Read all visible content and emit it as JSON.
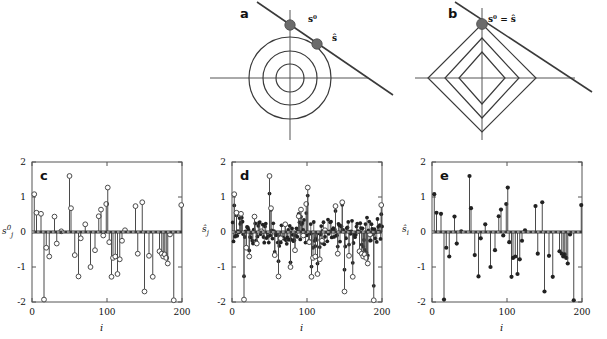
{
  "figure": {
    "caption_letters": [
      "a",
      "b",
      "c",
      "d",
      "e"
    ],
    "colors": {
      "stroke": "#3a3a3a",
      "marker_fill": "#6b6b6b",
      "axis": "#555555",
      "text": "#111111"
    }
  },
  "panel_a": {
    "letter": "a",
    "type": "geometry",
    "contour_shape": "circle",
    "contour_count": 3,
    "label_s0": "s⁰",
    "label_shat": "ŝ",
    "description": "L2 / ridge: circular contours intersect constraint line away from axis"
  },
  "panel_b": {
    "letter": "b",
    "type": "geometry",
    "contour_shape": "diamond",
    "contour_count": 3,
    "label_equality": "s⁰ = ŝ",
    "description": "L1 / lasso: diamond contours touch constraint line at vertex"
  },
  "chart_data": [
    {
      "panel": "c",
      "letter": "c",
      "type": "stem",
      "marker": "open-circle",
      "title": "",
      "xlabel": "i",
      "ylabel": "s⁰j",
      "ylabel_parts": {
        "base": "s",
        "sup": "0",
        "sub": "j"
      },
      "xlim": [
        0,
        200
      ],
      "ylim": [
        -2,
        2
      ],
      "xticks": [
        0,
        100,
        200
      ],
      "yticks": [
        -2,
        -1,
        0,
        1,
        2
      ],
      "grid": false,
      "legend": "none",
      "x": [
        3,
        6,
        12,
        16,
        19,
        23,
        30,
        33,
        39,
        50,
        52,
        57,
        62,
        65,
        71,
        78,
        84,
        89,
        92,
        95,
        99,
        101,
        103,
        106,
        108,
        111,
        114,
        117,
        120,
        124,
        138,
        141,
        147,
        150,
        156,
        161,
        170,
        173,
        175,
        177,
        179,
        181,
        184,
        189,
        199
      ],
      "y": [
        1.08,
        0.55,
        0.52,
        -1.93,
        -0.45,
        -0.7,
        0.44,
        -0.33,
        0.02,
        1.6,
        0.68,
        -0.66,
        -1.27,
        -0.18,
        0.22,
        -1.0,
        -0.52,
        0.45,
        0.64,
        -0.1,
        0.8,
        1.27,
        -0.29,
        -1.28,
        -0.74,
        -0.7,
        -1.2,
        -0.78,
        -0.25,
        0.05,
        0.74,
        -0.62,
        0.85,
        -1.7,
        -0.68,
        -1.28,
        -0.55,
        -0.62,
        -0.7,
        -0.64,
        -0.74,
        -0.9,
        -0.07,
        -1.95,
        0.77
      ]
    },
    {
      "panel": "d",
      "letter": "d",
      "type": "stem",
      "marker": "filled-dot-over-open-circle",
      "title": "",
      "xlabel": "i",
      "ylabel": "ŝj",
      "ylabel_parts": {
        "base": "ŝ",
        "sub": "j"
      },
      "xlim": [
        0,
        200
      ],
      "ylim": [
        -2,
        2
      ],
      "xticks": [
        0,
        100,
        200
      ],
      "yticks": [
        -2,
        -1,
        0,
        1,
        2
      ],
      "grid": false,
      "legend": "none",
      "note": "dense noisy estimate: every index has a non-zero value (L2 solution), sparse true spikes shown as open circles",
      "dense_count": 200,
      "noise_amplitude": 0.3
    },
    {
      "panel": "e",
      "letter": "e",
      "type": "stem",
      "marker": "filled-dot",
      "title": "",
      "xlabel": "i",
      "ylabel": "ŝi",
      "ylabel_parts": {
        "base": "ŝ",
        "sub": "i"
      },
      "xlim": [
        0,
        200
      ],
      "ylim": [
        -2,
        2
      ],
      "xticks": [
        0,
        100,
        200
      ],
      "yticks": [
        -2,
        -1,
        0,
        1,
        2
      ],
      "grid": false,
      "legend": "none",
      "note": "sparse L1 estimate recovers the same support as panel c",
      "x": [
        3,
        6,
        12,
        16,
        19,
        23,
        30,
        33,
        39,
        50,
        52,
        57,
        62,
        65,
        71,
        78,
        84,
        89,
        92,
        95,
        99,
        101,
        103,
        106,
        108,
        111,
        114,
        117,
        120,
        124,
        138,
        141,
        147,
        150,
        156,
        161,
        170,
        173,
        175,
        177,
        179,
        181,
        184,
        189,
        199
      ],
      "y": [
        1.08,
        0.55,
        0.52,
        -1.93,
        -0.45,
        -0.7,
        0.44,
        -0.33,
        0.02,
        1.6,
        0.68,
        -0.66,
        -1.27,
        -0.18,
        0.22,
        -1.0,
        -0.52,
        0.45,
        0.64,
        -0.1,
        0.8,
        1.27,
        -0.29,
        -1.28,
        -0.74,
        -0.7,
        -1.2,
        -0.78,
        -0.25,
        0.05,
        0.74,
        -0.62,
        0.85,
        -1.7,
        -0.68,
        -1.28,
        -0.55,
        -0.62,
        -0.7,
        -0.64,
        -0.74,
        -0.9,
        -0.07,
        -1.95,
        0.77
      ]
    }
  ]
}
